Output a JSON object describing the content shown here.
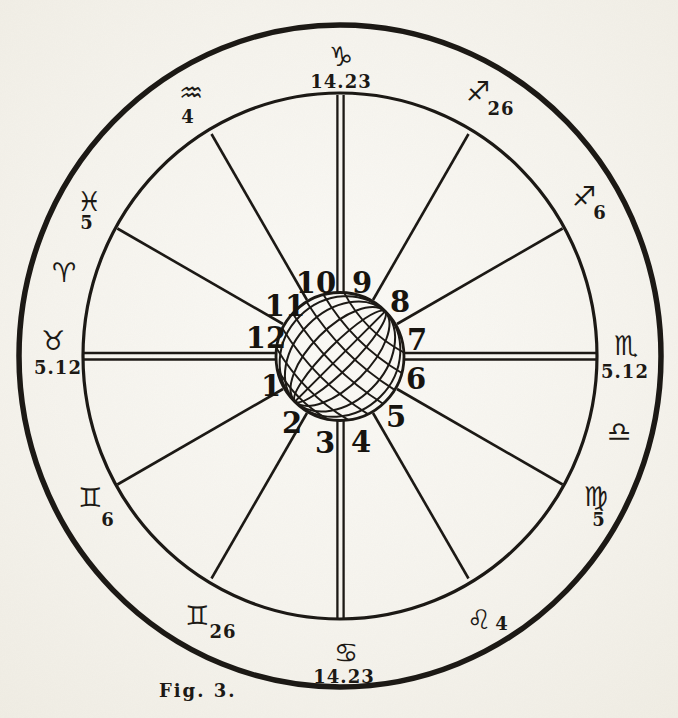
{
  "figure": {
    "caption": "Fig. 3."
  },
  "colors": {
    "paper": "#f6f4ee",
    "ink": "#1c1915"
  },
  "houses": [
    "1",
    "2",
    "3",
    "4",
    "5",
    "6",
    "7",
    "8",
    "9",
    "10",
    "11",
    "12"
  ],
  "cusps": [
    {
      "point": "midheaven",
      "sign": "Capricorn",
      "glyph": "♑",
      "degree": "14.23"
    },
    {
      "point": "eleventh-cusp",
      "sign": "Aquarius",
      "glyph": "♒",
      "degree": "4"
    },
    {
      "point": "twelfth-cusp",
      "sign": "Pisces",
      "glyph": "♓",
      "degree": "5"
    },
    {
      "point": "intercepted-sign",
      "sign": "Aries",
      "glyph": "♈",
      "degree": ""
    },
    {
      "point": "ascendant",
      "sign": "Taurus",
      "glyph": "♉",
      "degree": "5.12"
    },
    {
      "point": "second-cusp",
      "sign": "Gemini",
      "glyph": "♊",
      "degree": "6"
    },
    {
      "point": "third-cusp",
      "sign": "Gemini",
      "glyph": "♊",
      "degree": "26"
    },
    {
      "point": "imum-coeli",
      "sign": "Cancer",
      "glyph": "♋",
      "degree": "14.23"
    },
    {
      "point": "fifth-cusp",
      "sign": "Leo",
      "glyph": "♌",
      "degree": "4"
    },
    {
      "point": "sixth-cusp",
      "sign": "Virgo",
      "glyph": "♍",
      "degree": "5"
    },
    {
      "point": "intercepted-sign",
      "sign": "Libra",
      "glyph": "♎",
      "degree": ""
    },
    {
      "point": "descendant",
      "sign": "Scorpio",
      "glyph": "♏",
      "degree": "5.12"
    },
    {
      "point": "eighth-cusp",
      "sign": "Sagittarius",
      "glyph": "♐",
      "degree": "6"
    },
    {
      "point": "ninth-cusp",
      "sign": "Sagittarius",
      "glyph": "♐",
      "degree": "26"
    }
  ]
}
